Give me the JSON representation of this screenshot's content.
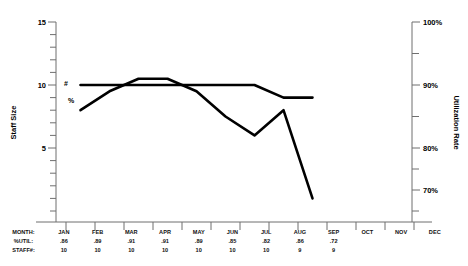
{
  "chart_data": {
    "type": "line",
    "title": "",
    "xlabel": "",
    "categories": [
      "JAN",
      "FEB",
      "MAR",
      "APR",
      "MAY",
      "JUN",
      "JUL",
      "AUG",
      "SEP",
      "OCT",
      "NOV",
      "DEC"
    ],
    "grid": false,
    "legend_position": "inline-left",
    "axes": {
      "left": {
        "label": "Staff Size",
        "ticks": [
          "15",
          "10",
          "5"
        ],
        "tick_values": [
          15,
          10,
          5
        ],
        "range": [
          0,
          15
        ],
        "minor_tick_step": 1
      },
      "right": {
        "label": "Utilization Rate",
        "ticks": [
          "100%",
          "90%",
          "80%",
          "70%"
        ],
        "tick_values": [
          100,
          90,
          80,
          70
        ],
        "range": [
          65,
          100
        ],
        "minor_tick_step": 5
      }
    },
    "series": [
      {
        "name": "#",
        "tag": "#",
        "axis": "left",
        "label": "Staff Size",
        "values": [
          10,
          10,
          10,
          10,
          10,
          10,
          10,
          9,
          9,
          null,
          null,
          null
        ]
      },
      {
        "name": "%",
        "tag": "%",
        "axis": "right",
        "label": "Utilization Rate",
        "values": [
          86,
          89,
          91,
          91,
          89,
          85,
          82,
          86,
          72,
          null,
          null,
          null
        ]
      }
    ]
  },
  "table": {
    "rows": [
      {
        "header": "MONTH:",
        "cells": [
          "JAN",
          "FEB",
          "MAR",
          "APR",
          "MAY",
          "JUN",
          "JUL",
          "AUG",
          "SEP",
          "OCT",
          "NOV",
          "DEC"
        ]
      },
      {
        "header": "%UTIL:",
        "cells": [
          ".86",
          ".89",
          ".91",
          ".91",
          ".89",
          ".85",
          ".82",
          ".86",
          ".72",
          "",
          "",
          ""
        ]
      },
      {
        "header": "STAFF#:",
        "cells": [
          "10",
          "10",
          "10",
          "10",
          "10",
          "10",
          "10",
          "9",
          "9",
          "",
          "",
          ""
        ]
      }
    ]
  },
  "colors": {
    "line": "#000000",
    "axis": "#6f6f6f",
    "text": "#000000",
    "background": "#ffffff"
  }
}
